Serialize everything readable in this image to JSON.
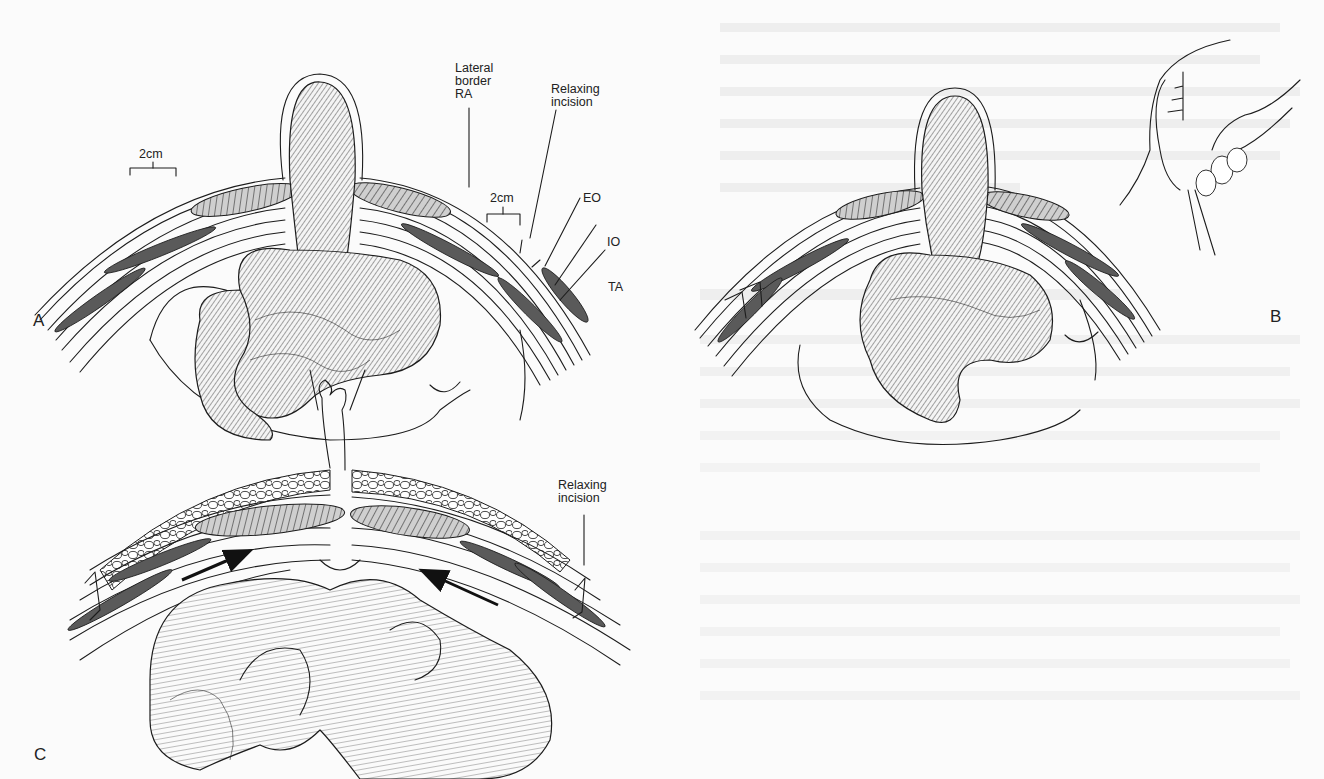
{
  "figure": {
    "panels": [
      {
        "id": "A",
        "letter": "A",
        "labels": {
          "width_left": "2cm",
          "lateral_border": "Lateral\nborder\nRA",
          "relaxing_incision": "Relaxing\nincision",
          "width_right": "2cm",
          "eo": "EO",
          "io": "IO",
          "ta": "TA"
        }
      },
      {
        "id": "B",
        "letter": "B",
        "labels": {}
      },
      {
        "id": "C",
        "letter": "C",
        "labels": {
          "relaxing_incision": "Relaxing\nincision"
        }
      }
    ],
    "colors": {
      "ink": "#1c1c1c",
      "paper": "#fbfbfb",
      "muscle_fill": "#cfcfcf"
    }
  }
}
